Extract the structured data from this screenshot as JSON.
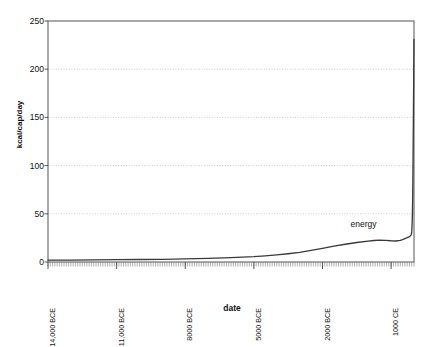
{
  "chart_data": {
    "type": "line",
    "title": "",
    "xlabel": "date",
    "ylabel": "kcal/cap/day",
    "ylim": [
      0,
      250
    ],
    "ytick_values": [
      0,
      50,
      100,
      150,
      200,
      250
    ],
    "ytick_labels": [
      "0",
      "50",
      "100",
      "150",
      "200",
      "250"
    ],
    "grid": true,
    "grid_axis": "y",
    "xlim_years": [
      -14000,
      2000
    ],
    "xtick_years": [
      -14000,
      -11000,
      -8000,
      -5000,
      -2000,
      1000
    ],
    "xtick_labels": [
      "14,000 BCE",
      "11,000 BCE",
      "8000 BCE",
      "5000 BCE",
      "2000 BCE",
      "1000 CE"
    ],
    "xtick_rotation": 90,
    "legend_position": "inline-annotation",
    "series": [
      {
        "name": "energy",
        "color": "#3a3a3a",
        "annotation": "energy",
        "annotation_at_year": -250,
        "annotation_value": 38,
        "x": [
          -14000,
          -13000,
          -12000,
          -11000,
          -10000,
          -9000,
          -8000,
          -7000,
          -6000,
          -5000,
          -4500,
          -4000,
          -3500,
          -3000,
          -2500,
          -2000,
          -1500,
          -1000,
          -500,
          0,
          250,
          500,
          750,
          1000,
          1200,
          1400,
          1500,
          1600,
          1700,
          1750,
          1800,
          1850,
          1870,
          1890,
          1900,
          1910,
          1920,
          1930,
          1940,
          1950,
          1960,
          1970,
          1980,
          1990,
          2000
        ],
        "y": [
          2,
          2,
          2.2,
          2.4,
          2.6,
          2.8,
          3.2,
          3.8,
          4.6,
          5.6,
          6.4,
          7.4,
          8.6,
          10,
          12,
          14.2,
          16.4,
          18.4,
          20.2,
          21.6,
          22.3,
          22.7,
          22.4,
          22,
          21.8,
          22.4,
          23.2,
          24.2,
          25.2,
          25.8,
          26.4,
          27.2,
          28,
          29.5,
          31.5,
          35,
          41,
          50,
          63,
          82,
          108,
          137,
          168,
          200,
          231
        ]
      }
    ]
  },
  "axes": {
    "y_axis_label": "kcal/cap/day",
    "x_axis_label": "date"
  },
  "colors": {
    "line": "#3a3a3a",
    "grid": "#b9b9b9",
    "axis": "#555555",
    "text": "#111111",
    "background": "#ffffff"
  }
}
